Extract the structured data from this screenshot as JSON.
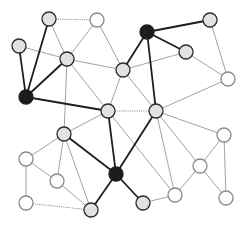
{
  "diagram": {
    "type": "network-graph",
    "width": 246,
    "height": 227,
    "colors": {
      "background": "#ffffff",
      "node_white_fill": "#ffffff",
      "node_white_stroke": "#8a8a8a",
      "node_gray_fill": "#e2e2e2",
      "node_gray_stroke": "#2a2a2a",
      "node_black_fill": "#1c1c1c",
      "node_black_stroke": "#1c1c1c"
    },
    "node_radius": 7,
    "nodes": [
      {
        "id": "A",
        "x": 49,
        "y": 19,
        "style": "gray"
      },
      {
        "id": "B",
        "x": 19,
        "y": 46,
        "style": "gray"
      },
      {
        "id": "C",
        "x": 26,
        "y": 97,
        "style": "black"
      },
      {
        "id": "D",
        "x": 97,
        "y": 20,
        "style": "white"
      },
      {
        "id": "E",
        "x": 67,
        "y": 59,
        "style": "gray"
      },
      {
        "id": "F",
        "x": 147,
        "y": 32,
        "style": "black"
      },
      {
        "id": "G",
        "x": 123,
        "y": 70,
        "style": "gray"
      },
      {
        "id": "H",
        "x": 210,
        "y": 20,
        "style": "gray"
      },
      {
        "id": "I",
        "x": 186,
        "y": 52,
        "style": "gray"
      },
      {
        "id": "J",
        "x": 228,
        "y": 79,
        "style": "white"
      },
      {
        "id": "K",
        "x": 108,
        "y": 111,
        "style": "gray"
      },
      {
        "id": "L",
        "x": 156,
        "y": 111,
        "style": "gray"
      },
      {
        "id": "M",
        "x": 64,
        "y": 134,
        "style": "gray"
      },
      {
        "id": "N",
        "x": 116,
        "y": 174,
        "style": "black"
      },
      {
        "id": "O",
        "x": 91,
        "y": 210,
        "style": "gray"
      },
      {
        "id": "P",
        "x": 143,
        "y": 203,
        "style": "gray"
      },
      {
        "id": "Q",
        "x": 224,
        "y": 135,
        "style": "white"
      },
      {
        "id": "R",
        "x": 200,
        "y": 166,
        "style": "white"
      },
      {
        "id": "S",
        "x": 226,
        "y": 198,
        "style": "white"
      },
      {
        "id": "T",
        "x": 175,
        "y": 195,
        "style": "white"
      },
      {
        "id": "U",
        "x": 26,
        "y": 159,
        "style": "white"
      },
      {
        "id": "V",
        "x": 57,
        "y": 181,
        "style": "white"
      },
      {
        "id": "W",
        "x": 26,
        "y": 203,
        "style": "white"
      }
    ],
    "edges": [
      {
        "from": "C",
        "to": "A",
        "style": "thick"
      },
      {
        "from": "C",
        "to": "B",
        "style": "thick"
      },
      {
        "from": "C",
        "to": "E",
        "style": "thick"
      },
      {
        "from": "C",
        "to": "K",
        "style": "thick"
      },
      {
        "from": "F",
        "to": "H",
        "style": "thick"
      },
      {
        "from": "F",
        "to": "I",
        "style": "thick"
      },
      {
        "from": "F",
        "to": "G",
        "style": "thick"
      },
      {
        "from": "F",
        "to": "L",
        "style": "thick"
      },
      {
        "from": "L",
        "to": "N",
        "style": "thick"
      },
      {
        "from": "K",
        "to": "N",
        "style": "thick"
      },
      {
        "from": "M",
        "to": "N",
        "style": "thick"
      },
      {
        "from": "N",
        "to": "O",
        "style": "thick"
      },
      {
        "from": "N",
        "to": "P",
        "style": "thick"
      },
      {
        "from": "A",
        "to": "D",
        "style": "dotted"
      },
      {
        "from": "K",
        "to": "L",
        "style": "dotted"
      },
      {
        "from": "W",
        "to": "O",
        "style": "dotted"
      },
      {
        "from": "A",
        "to": "E",
        "style": "thin"
      },
      {
        "from": "B",
        "to": "E",
        "style": "thin"
      },
      {
        "from": "D",
        "to": "E",
        "style": "thin"
      },
      {
        "from": "D",
        "to": "G",
        "style": "thin"
      },
      {
        "from": "E",
        "to": "K",
        "style": "thin"
      },
      {
        "from": "E",
        "to": "M",
        "style": "thin"
      },
      {
        "from": "G",
        "to": "K",
        "style": "thin"
      },
      {
        "from": "G",
        "to": "I",
        "style": "thin"
      },
      {
        "from": "G",
        "to": "E",
        "style": "thin"
      },
      {
        "from": "G",
        "to": "L",
        "style": "thin"
      },
      {
        "from": "I",
        "to": "J",
        "style": "thin"
      },
      {
        "from": "H",
        "to": "J",
        "style": "thin"
      },
      {
        "from": "J",
        "to": "L",
        "style": "thin"
      },
      {
        "from": "L",
        "to": "Q",
        "style": "thin"
      },
      {
        "from": "L",
        "to": "R",
        "style": "thin"
      },
      {
        "from": "L",
        "to": "T",
        "style": "thin"
      },
      {
        "from": "K",
        "to": "T",
        "style": "thin"
      },
      {
        "from": "K",
        "to": "M",
        "style": "thin"
      },
      {
        "from": "M",
        "to": "U",
        "style": "thin"
      },
      {
        "from": "M",
        "to": "V",
        "style": "thin"
      },
      {
        "from": "M",
        "to": "O",
        "style": "thin"
      },
      {
        "from": "U",
        "to": "V",
        "style": "thin"
      },
      {
        "from": "U",
        "to": "W",
        "style": "thin"
      },
      {
        "from": "V",
        "to": "O",
        "style": "thin"
      },
      {
        "from": "P",
        "to": "T",
        "style": "thin"
      },
      {
        "from": "T",
        "to": "R",
        "style": "thin"
      },
      {
        "from": "R",
        "to": "Q",
        "style": "thin"
      },
      {
        "from": "R",
        "to": "S",
        "style": "thin"
      },
      {
        "from": "Q",
        "to": "S",
        "style": "thin"
      }
    ]
  }
}
